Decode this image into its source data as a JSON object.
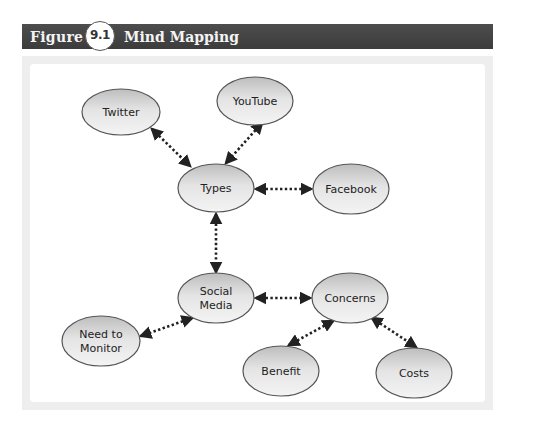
{
  "figure": {
    "label": "Figure",
    "number": "9.1",
    "title": "Mind Mapping"
  },
  "colors": {
    "header_bg": "#444444",
    "panel_bg": "#eeeeee",
    "node_fill_light": "#f0f0f0",
    "node_fill_dark": "#bcbcbc",
    "node_stroke": "#555555",
    "connector": "#222222"
  },
  "nodes": [
    {
      "id": "twitter",
      "label": "Twitter",
      "lines": [
        "Twitter"
      ],
      "cx": 121,
      "cy": 112,
      "rx": 39,
      "ry": 23
    },
    {
      "id": "youtube",
      "label": "YouTube",
      "lines": [
        "YouTube"
      ],
      "cx": 255,
      "cy": 101,
      "rx": 38,
      "ry": 24
    },
    {
      "id": "types",
      "label": "Types",
      "lines": [
        "Types"
      ],
      "cx": 216,
      "cy": 188,
      "rx": 38,
      "ry": 24
    },
    {
      "id": "facebook",
      "label": "Facebook",
      "lines": [
        "Facebook"
      ],
      "cx": 351,
      "cy": 189,
      "rx": 38,
      "ry": 25
    },
    {
      "id": "social-media",
      "label": "Social Media",
      "lines": [
        "Social",
        "Media"
      ],
      "cx": 216,
      "cy": 298,
      "rx": 38,
      "ry": 25
    },
    {
      "id": "need-to-monitor",
      "label": "Need to Monitor",
      "lines": [
        "Need to",
        "Monitor"
      ],
      "cx": 101,
      "cy": 341,
      "rx": 39,
      "ry": 25
    },
    {
      "id": "concerns",
      "label": "Concerns",
      "lines": [
        "Concerns"
      ],
      "cx": 350,
      "cy": 298,
      "rx": 38,
      "ry": 25
    },
    {
      "id": "benefit",
      "label": "Benefit",
      "lines": [
        "Benefit"
      ],
      "cx": 281,
      "cy": 371,
      "rx": 38,
      "ry": 25
    },
    {
      "id": "costs",
      "label": "Costs",
      "lines": [
        "Costs"
      ],
      "cx": 414,
      "cy": 373,
      "rx": 38,
      "ry": 25
    }
  ],
  "edges": [
    {
      "from": "twitter",
      "to": "types",
      "type": "bidirectional-dotted",
      "x1": 152,
      "y1": 129,
      "x2": 190,
      "y2": 166
    },
    {
      "from": "youtube",
      "to": "types",
      "type": "bidirectional-dotted",
      "x1": 262,
      "y1": 123,
      "x2": 226,
      "y2": 163
    },
    {
      "from": "types",
      "to": "facebook",
      "type": "bidirectional-dotted",
      "x1": 256,
      "y1": 189,
      "x2": 311,
      "y2": 189
    },
    {
      "from": "types",
      "to": "social-media",
      "type": "bidirectional-dotted",
      "x1": 216,
      "y1": 214,
      "x2": 216,
      "y2": 272
    },
    {
      "from": "social-media",
      "to": "concerns",
      "type": "bidirectional-dotted",
      "x1": 256,
      "y1": 298,
      "x2": 310,
      "y2": 298
    },
    {
      "from": "social-media",
      "to": "need-to-monitor",
      "type": "bidirectional-dotted",
      "x1": 192,
      "y1": 318,
      "x2": 141,
      "y2": 336
    },
    {
      "from": "concerns",
      "to": "benefit",
      "type": "bidirectional-dotted",
      "x1": 333,
      "y1": 321,
      "x2": 289,
      "y2": 345
    },
    {
      "from": "concerns",
      "to": "costs",
      "type": "bidirectional-dotted",
      "x1": 372,
      "y1": 318,
      "x2": 416,
      "y2": 347
    }
  ]
}
